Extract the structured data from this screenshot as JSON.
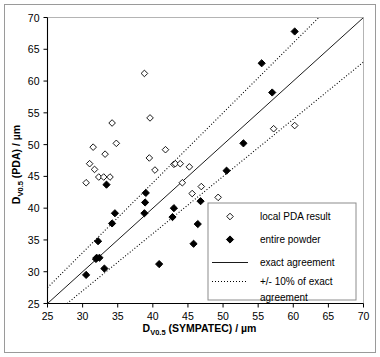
{
  "chart_data": {
    "type": "scatter",
    "title": "",
    "xlabel": "DV0.5 (SYMPATEC) / µm",
    "ylabel": "DV0.5 (PDA) / µm",
    "xlabel_main": "D",
    "xlabel_sub": "V0.5",
    "xlabel_rest": " (SYMPATEC) / µm",
    "ylabel_main": "D",
    "ylabel_sub": "V0.5",
    "ylabel_rest": " (PDA) / µm",
    "xlim": [
      25,
      70
    ],
    "ylim": [
      25,
      70
    ],
    "xticks": [
      25,
      30,
      35,
      40,
      45,
      50,
      55,
      60,
      65,
      70
    ],
    "yticks": [
      25,
      30,
      35,
      40,
      45,
      50,
      55,
      60,
      65,
      70
    ],
    "xticklabels": [
      "25",
      "30",
      "35",
      "40",
      "45",
      "50",
      "55",
      "60",
      "65",
      "70"
    ],
    "yticklabels": [
      "25",
      "30",
      "35",
      "40",
      "45",
      "50",
      "55",
      "60",
      "65",
      "70"
    ],
    "grid": false,
    "legend_position": "lower right",
    "series": [
      {
        "name": "local PDA result",
        "marker": "open-diamond",
        "color": "#000000",
        "points": [
          [
            30.5,
            44.0
          ],
          [
            31.0,
            47.0
          ],
          [
            31.5,
            49.6
          ],
          [
            31.7,
            46.1
          ],
          [
            32.3,
            44.9
          ],
          [
            33.0,
            44.9
          ],
          [
            33.2,
            48.5
          ],
          [
            33.9,
            44.9
          ],
          [
            34.2,
            53.4
          ],
          [
            34.8,
            50.2
          ],
          [
            38.8,
            61.2
          ],
          [
            39.5,
            47.9
          ],
          [
            39.6,
            54.2
          ],
          [
            40.3,
            46.0
          ],
          [
            41.8,
            49.2
          ],
          [
            43.0,
            46.9
          ],
          [
            43.2,
            47.0
          ],
          [
            43.9,
            47.0
          ],
          [
            44.2,
            44.0
          ],
          [
            45.2,
            46.5
          ],
          [
            45.6,
            42.3
          ],
          [
            46.9,
            43.4
          ],
          [
            49.3,
            41.7
          ],
          [
            57.2,
            52.5
          ],
          [
            60.2,
            53.0
          ]
        ]
      },
      {
        "name": "entire powder",
        "marker": "filled-diamond",
        "color": "#000000",
        "points": [
          [
            30.5,
            29.5
          ],
          [
            31.9,
            32.0
          ],
          [
            32.0,
            32.2
          ],
          [
            32.2,
            34.8
          ],
          [
            32.4,
            32.2
          ],
          [
            33.1,
            30.5
          ],
          [
            33.4,
            43.7
          ],
          [
            34.2,
            37.6
          ],
          [
            34.6,
            39.2
          ],
          [
            38.8,
            39.2
          ],
          [
            38.9,
            40.9
          ],
          [
            39.0,
            42.4
          ],
          [
            40.9,
            31.2
          ],
          [
            42.8,
            38.6
          ],
          [
            43.0,
            40.0
          ],
          [
            45.8,
            34.4
          ],
          [
            46.4,
            37.5
          ],
          [
            46.8,
            41.1
          ],
          [
            50.5,
            45.9
          ],
          [
            52.9,
            50.2
          ],
          [
            55.5,
            62.8
          ],
          [
            57.0,
            58.2
          ],
          [
            60.2,
            67.8
          ]
        ]
      }
    ],
    "lines": [
      {
        "name": "exact agreement",
        "style": "solid",
        "color": "#000000",
        "from": [
          25,
          25
        ],
        "to": [
          70,
          70
        ]
      },
      {
        "name": "+10% of exact agreement",
        "style": "dotted",
        "color": "#000000",
        "from": [
          25,
          27.5
        ],
        "to": [
          63.64,
          70
        ]
      },
      {
        "name": "-10% of exact agreement",
        "style": "dotted",
        "color": "#000000",
        "from": [
          27.78,
          25
        ],
        "to": [
          70,
          63
        ]
      }
    ],
    "legend": [
      {
        "label": "local PDA result",
        "marker": "open-diamond"
      },
      {
        "label": "entire powder",
        "marker": "filled-diamond"
      },
      {
        "label": "exact agreement",
        "marker": "solid-line"
      },
      {
        "label": "+/- 10% of exact",
        "label2": "agreement",
        "marker": "dotted-line"
      }
    ]
  },
  "colors": {
    "frame": "#9a9a9a",
    "axis": "#000000",
    "marker": "#000000",
    "background": "#ffffff"
  }
}
